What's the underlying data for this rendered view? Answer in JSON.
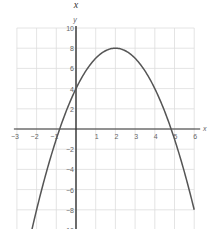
{
  "chart_data": {
    "type": "line",
    "title": "x",
    "xlabel": "x",
    "ylabel": "y",
    "xlim": [
      -3,
      6
    ],
    "ylim": [
      -10,
      10
    ],
    "grid": true,
    "legend": null,
    "x_ticks": [
      -3,
      -2,
      -1,
      1,
      2,
      3,
      4,
      5,
      6
    ],
    "y_ticks": [
      10,
      8,
      6,
      4,
      2,
      -2,
      -4,
      -6,
      -8,
      -10
    ],
    "series": [
      {
        "name": "y = -x^2 + 4x + 4",
        "x": [
          -2.25,
          -2,
          -1.5,
          -1,
          -0.83,
          -0.5,
          0,
          0.5,
          1,
          1.5,
          2,
          2.5,
          3,
          3.5,
          4,
          4.5,
          4.83,
          5,
          5.5,
          6
        ],
        "values": [
          -10.06,
          -8,
          -4.25,
          -1,
          0,
          1.75,
          4,
          5.75,
          7,
          7.75,
          8,
          7.75,
          7,
          5.75,
          4,
          1.75,
          0,
          -1,
          -4.25,
          -8
        ]
      }
    ],
    "annotations": {
      "vertex": [
        2,
        8
      ],
      "y_intercept": 4,
      "x_intercepts": [
        -0.83,
        4.83
      ]
    }
  },
  "labels": {
    "title": "x",
    "x_axis": "x",
    "y_axis": "y"
  }
}
